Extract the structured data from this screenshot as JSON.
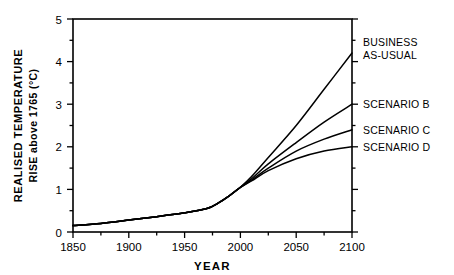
{
  "chart_data": {
    "type": "line",
    "title": "",
    "xlabel": "YEAR",
    "ylabel_line1": "REALISED  TEMPERATURE",
    "ylabel_line2": "RISE above 1765 (°C)",
    "xlim": [
      1850,
      2100
    ],
    "ylim": [
      0,
      5
    ],
    "xticks": [
      1850,
      1900,
      1950,
      2000,
      2050,
      2100
    ],
    "xtick_labels": [
      "1850",
      "1900",
      "1950",
      "2000",
      "2050",
      "2100"
    ],
    "xminor_step": 25,
    "yticks": [
      0,
      1,
      2,
      3,
      4,
      5
    ],
    "ytick_labels": [
      "0",
      "1",
      "2",
      "3",
      "4",
      "5"
    ],
    "yminor_step": 0.5,
    "grid": false,
    "legend_position": "right-inline-labels",
    "line_color": "#000000",
    "frame_color": "#000000",
    "background": "#ffffff",
    "series": [
      {
        "name": "BUSINESS AS-USUAL",
        "label_line1": "BUSINESS",
        "label_line2": "AS-USUAL",
        "label_value_at_2100": 4.2,
        "x": [
          1850,
          1875,
          1900,
          1925,
          1950,
          1970,
          1980,
          1990,
          2000,
          2010,
          2025,
          2050,
          2075,
          2100
        ],
        "values": [
          0.15,
          0.2,
          0.28,
          0.36,
          0.45,
          0.55,
          0.68,
          0.85,
          1.05,
          1.3,
          1.75,
          2.5,
          3.35,
          4.2
        ]
      },
      {
        "name": "SCENARIO B",
        "label_line1": "SCENARIO B",
        "label_value_at_2100": 3.0,
        "x": [
          1850,
          1875,
          1900,
          1925,
          1950,
          1970,
          1980,
          1990,
          2000,
          2010,
          2025,
          2050,
          2075,
          2100
        ],
        "values": [
          0.15,
          0.2,
          0.28,
          0.36,
          0.45,
          0.55,
          0.68,
          0.85,
          1.05,
          1.25,
          1.6,
          2.1,
          2.58,
          3.0
        ]
      },
      {
        "name": "SCENARIO C",
        "label_line1": "SCENARIO C",
        "label_value_at_2100": 2.4,
        "x": [
          1850,
          1875,
          1900,
          1925,
          1950,
          1970,
          1980,
          1990,
          2000,
          2010,
          2025,
          2050,
          2075,
          2100
        ],
        "values": [
          0.15,
          0.2,
          0.28,
          0.36,
          0.45,
          0.55,
          0.68,
          0.85,
          1.05,
          1.22,
          1.5,
          1.9,
          2.18,
          2.4
        ]
      },
      {
        "name": "SCENARIO D",
        "label_line1": "SCENARIO D",
        "label_value_at_2100": 2.0,
        "x": [
          1850,
          1875,
          1900,
          1925,
          1950,
          1970,
          1980,
          1990,
          2000,
          2010,
          2025,
          2050,
          2075,
          2100
        ],
        "values": [
          0.15,
          0.2,
          0.28,
          0.36,
          0.45,
          0.55,
          0.68,
          0.85,
          1.05,
          1.2,
          1.44,
          1.72,
          1.9,
          2.0
        ]
      }
    ]
  }
}
